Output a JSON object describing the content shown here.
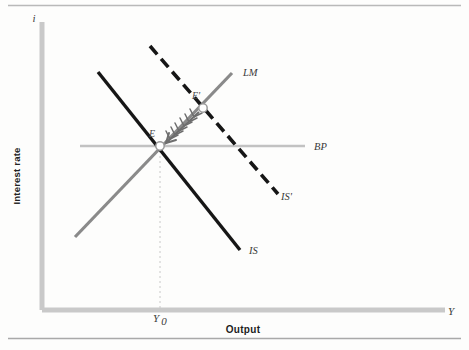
{
  "figure": {
    "background_color": "#fdfdfc",
    "rules": {
      "top_rule_color": "#b9b9b9",
      "bottom_rule_color": "#a9a9a9"
    },
    "axes": {
      "color": "#c9c9c9",
      "vertical_axis_label": "i",
      "horizontal_axis_label": "Y",
      "vertical_caption": "Interest rate",
      "horizontal_caption": "Output",
      "origin_x": 42,
      "origin_y": 310,
      "top_y": 22,
      "right_x": 445
    },
    "tick": {
      "label": "Y",
      "subscript": "0",
      "x": 160,
      "y": 320
    },
    "curves": [
      {
        "id": "lm",
        "label": "LM",
        "style": "solid",
        "color": "#8a8a8a",
        "width": 3.2,
        "x1": 75,
        "y1": 237,
        "x2": 232,
        "y2": 73,
        "label_x": 243,
        "label_y": 76
      },
      {
        "id": "is",
        "label": "IS",
        "style": "solid",
        "color": "#161616",
        "width": 3.4,
        "x1": 98,
        "y1": 72,
        "x2": 240,
        "y2": 250,
        "label_x": 249,
        "label_y": 254
      },
      {
        "id": "is-prime",
        "label": "IS'",
        "style": "dashed",
        "color": "#161616",
        "width": 3.6,
        "dash": "11 6",
        "x1": 150,
        "y1": 46,
        "x2": 278,
        "y2": 194,
        "label_x": 281,
        "label_y": 200
      },
      {
        "id": "bp",
        "label": "BP",
        "style": "solid",
        "color": "#c2c2c2",
        "width": 2.4,
        "x1": 80,
        "y1": 146,
        "x2": 305,
        "y2": 146,
        "label_x": 314,
        "label_y": 150
      }
    ],
    "points": [
      {
        "id": "equilibrium-e",
        "label": "E",
        "x": 160,
        "y": 146,
        "radius": 4.2,
        "fill": "#ffffff",
        "stroke": "#9a9a9a",
        "label_x": 152,
        "label_y": 137
      },
      {
        "id": "equilibrium-e-prime",
        "label": "E'",
        "x": 203,
        "y": 108,
        "radius": 4.2,
        "fill": "#ffffff",
        "stroke": "#9a9a9a",
        "label_x": 196,
        "label_y": 99
      }
    ],
    "adjustment_arrow": {
      "id": "adjustment-arrow",
      "from_x": 199,
      "from_y": 112,
      "to_x": 166,
      "to_y": 143,
      "color": "#6e6e6e",
      "width": 2.0,
      "barb_count": 7,
      "description": "feathered arrow from E-prime to E"
    },
    "drop_line": {
      "color": "#c8c8c8",
      "dash": "2 3",
      "x": 160,
      "y1": 146,
      "y2": 310
    }
  }
}
